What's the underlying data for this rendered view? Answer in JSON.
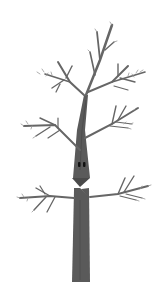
{
  "illustration": {
    "subject": "cartoon tree with face",
    "colors": {
      "background": "#ffffff",
      "trunk": "#5a5a5a",
      "trunk_shadow": "#3e3e3e",
      "branch": "#666666",
      "twig": "#8a8a8a",
      "eye": "#111111"
    }
  }
}
